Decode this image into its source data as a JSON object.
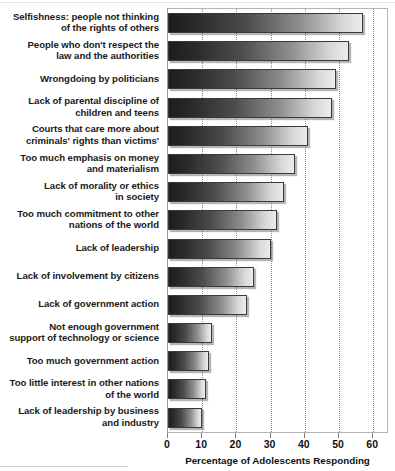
{
  "chart_data": {
    "type": "bar",
    "orientation": "horizontal",
    "title": "",
    "subtitle": "",
    "xlabel": "Percentage of Adolescents Responding",
    "ylabel": "",
    "xlim": [
      0,
      60
    ],
    "xticks": [
      0,
      10,
      20,
      30,
      40,
      50,
      60
    ],
    "xtick_labels": [
      "0",
      "10",
      "20",
      "30",
      "40",
      "50",
      "60"
    ],
    "grid": true,
    "grid_axis": "x",
    "grid_style": "dotted",
    "legend": false,
    "categories": [
      "Selfishness: people not thinking of the rights of others",
      "People who don't respect the law and the authorities",
      "Wrongdoing by politicians",
      "Lack of parental discipline of children and teens",
      "Courts that care more about criminals' rights than victims'",
      "Too much emphasis on money and materialism",
      "Lack of morality or ethics in society",
      "Too much commitment to other nations of the world",
      "Lack of leadership",
      "Lack of involvement by citizens",
      "Lack of government action",
      "Not enough government support of technology or science",
      "Too much government action",
      "Too little interest in other nations of the world",
      "Lack of leadership by business and industry"
    ],
    "category_lines": [
      [
        "Selfishness: people not thinking",
        "of the rights of others"
      ],
      [
        "People who don't respect the",
        "law and the authorities"
      ],
      [
        "Wrongdoing by politicians"
      ],
      [
        "Lack of parental discipline of",
        "children and teens"
      ],
      [
        "Courts that care more about",
        "criminals' rights than victims'"
      ],
      [
        "Too much emphasis on money",
        "and materialism"
      ],
      [
        "Lack of morality or ethics",
        "in society"
      ],
      [
        "Too much commitment to other",
        "nations of the world"
      ],
      [
        "Lack of leadership"
      ],
      [
        "Lack of involvement by citizens"
      ],
      [
        "Lack of government action"
      ],
      [
        "Not enough government",
        "support of technology or science"
      ],
      [
        "Too much government action"
      ],
      [
        "Too little interest in other nations",
        "of the world"
      ],
      [
        "Lack of leadership by business",
        "and industry"
      ]
    ],
    "values": [
      57,
      53,
      49,
      48,
      41,
      37,
      34,
      32,
      30,
      25,
      23,
      13,
      12,
      11,
      10
    ],
    "bar_gradient": {
      "direction": "left-to-right",
      "from": "#1d1d1d",
      "to": "#ececec"
    },
    "colors": {
      "bar_border": "#3a3a3a",
      "gridline": "#8a8a8a",
      "plot_border": "#b4b4b4",
      "text": "#111111",
      "background": "#ffffff"
    }
  }
}
